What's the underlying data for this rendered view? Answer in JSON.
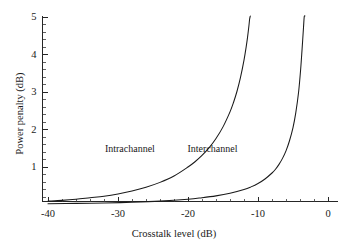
{
  "chart_data": {
    "type": "line",
    "title": "",
    "xlabel": "Crosstalk level (dB)",
    "ylabel": "Power penalty (dB)",
    "xlim": [
      -42.5,
      0.8
    ],
    "ylim": [
      0,
      5.15
    ],
    "grid": false,
    "legend_position": "inline-annotations",
    "xticks": [
      -40,
      -30,
      -20,
      -10,
      0
    ],
    "xticklabels": [
      "-40",
      "-30",
      "-20",
      "-10",
      "0"
    ],
    "xtick_minor_step": 2,
    "yticks": [
      1,
      2,
      3,
      4,
      5
    ],
    "yticklabels": [
      "1",
      "2",
      "3",
      "4",
      "5"
    ],
    "ytick_minor_step": 0.2,
    "series": [
      {
        "name": "Intrachannel",
        "annotation": "Intrachannel",
        "asymptote_db": -10.8,
        "x": [
          -40,
          -38,
          -36,
          -34,
          -32,
          -30,
          -28,
          -26,
          -24,
          -22,
          -20,
          -19,
          -18,
          -17,
          -16,
          -15,
          -14,
          -13.5,
          -13,
          -12.5,
          -12,
          -11.7,
          -11.5,
          -11.3,
          -11.2,
          -11.1
        ],
        "values": [
          0.09,
          0.11,
          0.14,
          0.18,
          0.22,
          0.28,
          0.36,
          0.46,
          0.59,
          0.76,
          1.0,
          1.14,
          1.31,
          1.51,
          1.76,
          2.07,
          2.47,
          2.72,
          3.02,
          3.39,
          3.85,
          4.19,
          4.45,
          4.76,
          4.94,
          5.13
        ]
      },
      {
        "name": "Interchannel",
        "annotation": "Interchannel",
        "asymptote_db": -2.9,
        "x": [
          -40,
          -36,
          -32,
          -28,
          -24,
          -20,
          -18,
          -16,
          -14,
          -12,
          -11,
          -10,
          -9,
          -8,
          -7.5,
          -7,
          -6.5,
          -6,
          -5.5,
          -5,
          -4.6,
          -4.2,
          -3.9,
          -3.7,
          -3.5,
          -3.4,
          -3.3
        ],
        "values": [
          0.02,
          0.03,
          0.04,
          0.06,
          0.09,
          0.14,
          0.18,
          0.23,
          0.3,
          0.4,
          0.47,
          0.56,
          0.68,
          0.84,
          0.94,
          1.07,
          1.23,
          1.43,
          1.7,
          2.05,
          2.45,
          3.0,
          3.62,
          4.15,
          4.72,
          5.0,
          5.15
        ]
      }
    ],
    "annotations": [
      {
        "text": "Intrachannel",
        "x": -28.3,
        "y": 1.52
      },
      {
        "text": "Interchannel",
        "x": -16.5,
        "y": 1.52
      }
    ]
  },
  "colors": {
    "background": "#ffffff",
    "axis": "#262626",
    "curve": "#1a1a1a",
    "text": "#1a1a1a"
  }
}
